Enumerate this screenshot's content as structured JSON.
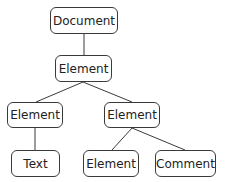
{
  "diagram": {
    "type": "tree",
    "nodes": [
      {
        "id": "document",
        "label": "Document",
        "x": 50,
        "y": 7,
        "w": 68,
        "h": 27
      },
      {
        "id": "element-root",
        "label": "Element",
        "x": 55,
        "y": 55,
        "w": 57,
        "h": 27
      },
      {
        "id": "element-left",
        "label": "Element",
        "x": 7,
        "y": 102,
        "w": 56,
        "h": 26
      },
      {
        "id": "element-right",
        "label": "Element",
        "x": 104,
        "y": 102,
        "w": 56,
        "h": 26
      },
      {
        "id": "text",
        "label": "Text",
        "x": 11,
        "y": 150,
        "w": 49,
        "h": 27
      },
      {
        "id": "element-leaf",
        "label": "Element",
        "x": 83,
        "y": 150,
        "w": 56,
        "h": 27
      },
      {
        "id": "comment",
        "label": "Comment",
        "x": 155,
        "y": 150,
        "w": 61,
        "h": 27
      }
    ],
    "edges": [
      {
        "from": "document",
        "to": "element-root"
      },
      {
        "from": "element-root",
        "to": "element-left"
      },
      {
        "from": "element-root",
        "to": "element-right"
      },
      {
        "from": "element-left",
        "to": "text"
      },
      {
        "from": "element-right",
        "to": "element-leaf"
      },
      {
        "from": "element-right",
        "to": "comment"
      }
    ],
    "colors": {
      "stroke": "#3a3a3a",
      "fill": "#ffffff",
      "text": "#222222"
    }
  }
}
